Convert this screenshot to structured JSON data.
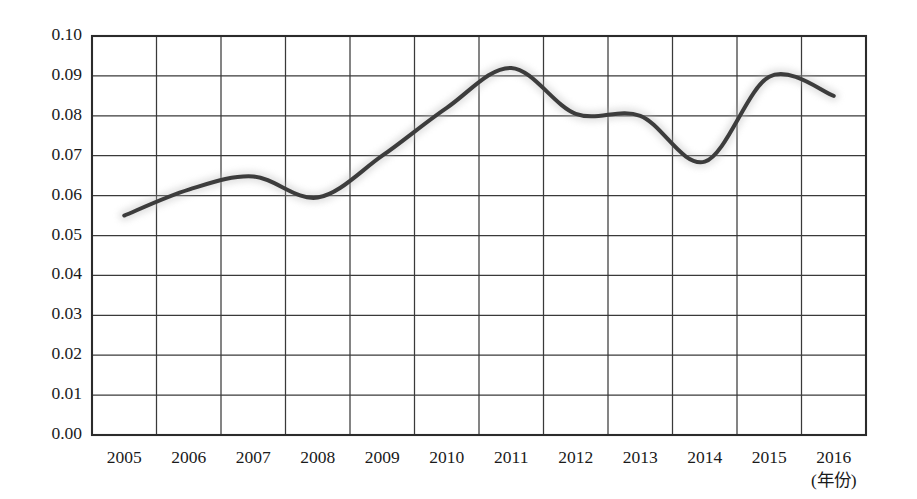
{
  "chart_data": {
    "type": "line",
    "title": "",
    "subtitle": "",
    "xlabel": "(年份)",
    "ylabel": "",
    "categories": [
      "2005",
      "2006",
      "2007",
      "2008",
      "2009",
      "2010",
      "2011",
      "2012",
      "2013",
      "2014",
      "2015",
      "2016"
    ],
    "x": [
      2005,
      2006,
      2007,
      2008,
      2009,
      2010,
      2011,
      2012,
      2013,
      2014,
      2015,
      2016
    ],
    "values": [
      0.055,
      0.0615,
      0.0648,
      0.0595,
      0.07,
      0.082,
      0.092,
      0.0805,
      0.08,
      0.0685,
      0.0898,
      0.085
    ],
    "series": [
      {
        "name": "",
        "values": [
          0.055,
          0.0615,
          0.0648,
          0.0595,
          0.07,
          0.082,
          0.092,
          0.0805,
          0.08,
          0.0685,
          0.0898,
          0.085
        ]
      }
    ],
    "xlim": [
      2004.5,
      2016.5
    ],
    "ylim": [
      0.0,
      0.1
    ],
    "yticks": [
      0.0,
      0.01,
      0.02,
      0.03,
      0.04,
      0.05,
      0.06,
      0.07,
      0.08,
      0.09,
      0.1
    ],
    "ytick_labels": [
      "0.00",
      "0.01",
      "0.02",
      "0.03",
      "0.04",
      "0.05",
      "0.06",
      "0.07",
      "0.08",
      "0.09",
      "0.10"
    ],
    "xtick_labels": [
      "2005",
      "2006",
      "2007",
      "2008",
      "2009",
      "2010",
      "2011",
      "2012",
      "2013",
      "2014",
      "2015",
      "2016"
    ],
    "grid": true,
    "grid_axes": "both",
    "legend": false,
    "legend_position": "none",
    "line_color": "#3c3c3c",
    "grid_color": "#3a3a3a",
    "frame_color": "#2b2b2b",
    "background_color": "#ffffff",
    "markers": false,
    "smoothing": "spline",
    "annotations": []
  },
  "axis": {
    "x_unit_label": "(年份)"
  }
}
